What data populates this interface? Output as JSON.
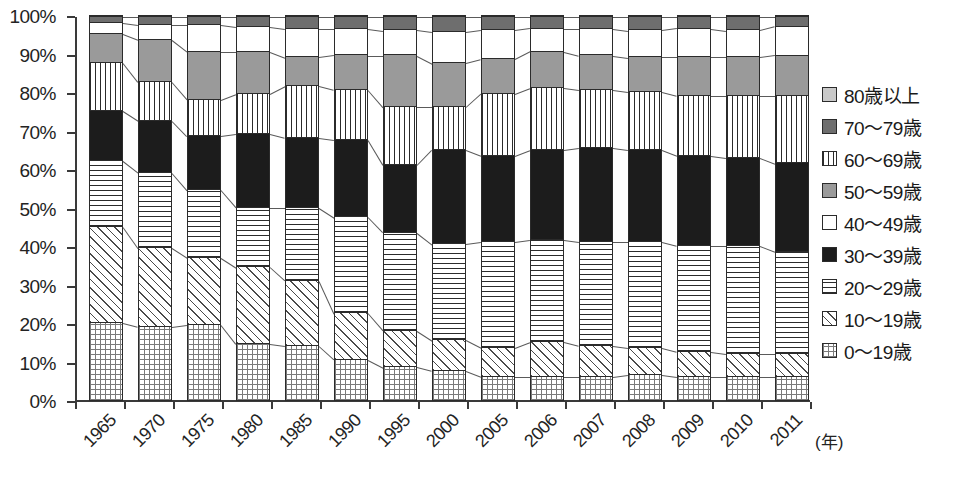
{
  "chart_data": {
    "type": "bar",
    "subtype": "stacked-percentage",
    "title": "",
    "xlabel": "(年)",
    "ylabel": "",
    "ylim": [
      0,
      100
    ],
    "ytick_labels": [
      "100%",
      "90%",
      "80%",
      "70%",
      "60%",
      "50%",
      "40%",
      "30%",
      "20%",
      "10%",
      "0%"
    ],
    "ytick_values": [
      100,
      90,
      80,
      70,
      60,
      50,
      40,
      30,
      20,
      10,
      0
    ],
    "grid": false,
    "legend_position": "right",
    "categories": [
      "1965",
      "1970",
      "1975",
      "1980",
      "1985",
      "1990",
      "1995",
      "2000",
      "2005",
      "2006",
      "2007",
      "2008",
      "2009",
      "2010",
      "2011"
    ],
    "stack_order_bottom_to_top": [
      "0〜19歳",
      "10〜19歳",
      "20〜29歳",
      "30〜39歳",
      "40〜49歳",
      "50〜59歳",
      "60〜69歳",
      "70〜79歳",
      "80歳以上"
    ],
    "series": [
      {
        "name": "0〜19歳",
        "pattern": "fine-grid",
        "values": [
          20.5,
          19.5,
          20.0,
          15.0,
          14.5,
          11.0,
          9.0,
          8.0,
          6.5,
          6.5,
          6.5,
          7.0,
          6.5,
          6.5,
          6.5
        ]
      },
      {
        "name": "10〜19歳",
        "pattern": "diagonal-hatch",
        "values": [
          25.0,
          20.5,
          17.5,
          20.0,
          17.0,
          12.0,
          9.5,
          8.0,
          7.5,
          9.0,
          8.0,
          7.0,
          6.5,
          6.0,
          6.0
        ]
      },
      {
        "name": "20〜29歳",
        "pattern": "horizontal-lines",
        "values": [
          17.0,
          19.5,
          17.5,
          15.5,
          19.0,
          25.0,
          25.5,
          25.0,
          27.5,
          26.5,
          27.0,
          27.5,
          27.5,
          28.0,
          26.5
        ]
      },
      {
        "name": "30〜39歳",
        "pattern": "solid-black",
        "values": [
          13.0,
          13.5,
          14.0,
          19.0,
          18.0,
          20.0,
          17.5,
          24.5,
          22.5,
          23.5,
          24.5,
          24.0,
          23.5,
          23.0,
          23.0
        ]
      },
      {
        "name": "40〜49歳",
        "pattern": "vertical-lines",
        "values": [
          12.5,
          10.0,
          9.5,
          10.5,
          13.5,
          13.0,
          15.0,
          11.0,
          16.0,
          16.0,
          15.0,
          15.0,
          15.5,
          16.0,
          17.5
        ]
      },
      {
        "name": "50〜59歳",
        "pattern": "solid-gray",
        "values": [
          7.5,
          11.0,
          12.5,
          11.0,
          7.5,
          9.0,
          13.5,
          11.5,
          9.0,
          9.5,
          9.0,
          9.0,
          10.0,
          10.0,
          10.5
        ]
      },
      {
        "name": "60〜69歳",
        "pattern": "white",
        "values": [
          3.0,
          4.0,
          7.0,
          6.5,
          7.5,
          7.0,
          6.5,
          8.0,
          7.5,
          6.0,
          7.0,
          7.0,
          7.5,
          7.0,
          7.5
        ]
      },
      {
        "name": "70〜79歳",
        "pattern": "solid-dark-gray",
        "values": [
          1.5,
          2.0,
          2.0,
          2.5,
          3.0,
          3.0,
          3.5,
          4.0,
          3.5,
          3.0,
          3.0,
          3.5,
          3.0,
          3.5,
          2.5
        ]
      },
      {
        "name": "80歳以上",
        "pattern": "solid-light-gray",
        "values": [
          0.0,
          0.0,
          0.0,
          0.0,
          0.0,
          0.0,
          0.0,
          0.0,
          0.0,
          0.0,
          0.0,
          0.0,
          0.0,
          0.0,
          0.0
        ]
      }
    ]
  },
  "legend": {
    "items": [
      {
        "label": "80歳以上",
        "pattern": "p-80"
      },
      {
        "label": "70〜79歳",
        "pattern": "p-70"
      },
      {
        "label": "60〜69歳",
        "pattern": "p-40"
      },
      {
        "label": "50〜59歳",
        "pattern": "p-50"
      },
      {
        "label": "40〜49歳",
        "pattern": "p-60"
      },
      {
        "label": "30〜39歳",
        "pattern": "p-30"
      },
      {
        "label": "20〜29歳",
        "pattern": "p-20"
      },
      {
        "label": "10〜19歳",
        "pattern": "p-10"
      },
      {
        "label": "0〜19歳",
        "pattern": "p-0"
      }
    ]
  },
  "axis": {
    "x_unit_label": "(年)"
  },
  "colors": {
    "axis": "#3a3a3a",
    "text": "#1a1a1a",
    "segment_border": "#2b2b2b",
    "connector": "#5a5a5a",
    "light_gray": "#c9c9c9",
    "mid_gray": "#9a9a9a",
    "dark_gray": "#6e6e6e",
    "black": "#1c1c1c",
    "white": "#ffffff"
  }
}
